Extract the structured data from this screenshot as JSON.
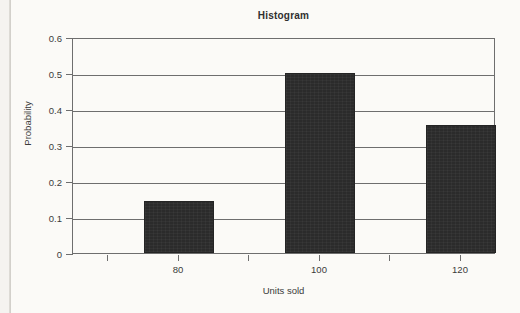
{
  "chart_data": {
    "type": "bar",
    "title": "Histogram",
    "xlabel": "Units sold",
    "ylabel": "Probability",
    "categories": [
      "80",
      "100",
      "120"
    ],
    "values": [
      0.145,
      0.5,
      0.355
    ],
    "ylim": [
      0,
      0.6
    ],
    "y_ticks": [
      "0",
      "0.1",
      "0.2",
      "0.3",
      "0.4",
      "0.5",
      "0.6"
    ],
    "y_tick_values": [
      0,
      0.1,
      0.2,
      0.3,
      0.4,
      0.5,
      0.6
    ],
    "x_ticks": [
      "",
      "80",
      "",
      "100",
      "",
      "120"
    ],
    "grid": true,
    "legend": "none",
    "bar_color": "#2b2b2b",
    "axis_color": "#6e6e6e",
    "background_color": "#fbfaf7"
  }
}
